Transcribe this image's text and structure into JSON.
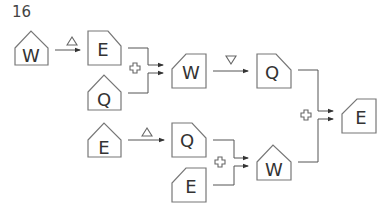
{
  "puzzle": {
    "number": "16",
    "nodes": [
      {
        "id": "n1",
        "letter": "W",
        "shape": "house"
      },
      {
        "id": "n2",
        "letter": "E",
        "shape": "clip-top-right"
      },
      {
        "id": "n3",
        "letter": "Q",
        "shape": "house"
      },
      {
        "id": "n4",
        "letter": "W",
        "shape": "clip-top-left"
      },
      {
        "id": "n5",
        "letter": "Q",
        "shape": "clip-top-right"
      },
      {
        "id": "n6",
        "letter": "E",
        "shape": "house"
      },
      {
        "id": "n7",
        "letter": "Q",
        "shape": "clip-top-right"
      },
      {
        "id": "n8",
        "letter": "E",
        "shape": "clip-top-left"
      },
      {
        "id": "n9",
        "letter": "W",
        "shape": "house"
      },
      {
        "id": "n10",
        "letter": "E",
        "shape": "clip-top-left"
      }
    ],
    "operators": [
      {
        "id": "op1",
        "type": "triangle-up",
        "from": "n1",
        "to": "n2"
      },
      {
        "id": "op2",
        "type": "plus",
        "from": [
          "n2",
          "n3"
        ],
        "to": "n4"
      },
      {
        "id": "op3",
        "type": "triangle-down",
        "from": "n4",
        "to": "n5"
      },
      {
        "id": "op4",
        "type": "triangle-up",
        "from": "n6",
        "to": "n7"
      },
      {
        "id": "op5",
        "type": "plus",
        "from": [
          "n7",
          "n8"
        ],
        "to": "n9"
      },
      {
        "id": "op6",
        "type": "plus",
        "from": [
          "n5",
          "n9"
        ],
        "to": "n10"
      }
    ]
  }
}
